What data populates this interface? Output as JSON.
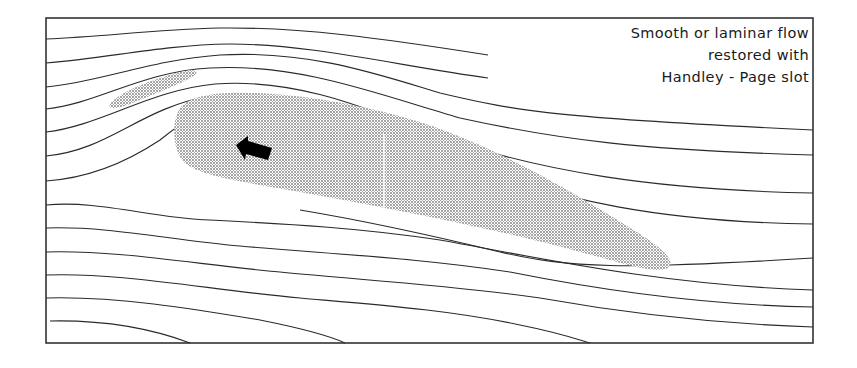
{
  "caption": {
    "line1": "Smooth or laminar flow",
    "line2": "restored with",
    "line3": "Handley - Page slot"
  },
  "colors": {
    "frame": "#333333",
    "streamline": "#2a2a2a",
    "stipple": "#9a9a9a",
    "arrow": "#000000",
    "background": "#ffffff"
  },
  "elements": {
    "main_wing": "aerofoil (stippled)",
    "slat": "leading-edge slat (stippled)",
    "arrow": "direction-of-motion arrow pointing forward-left",
    "streamlines_count": 13
  }
}
